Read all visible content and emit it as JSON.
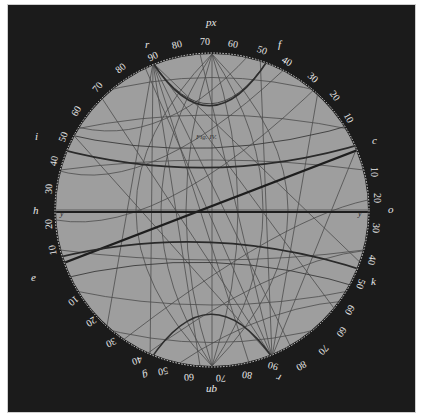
{
  "figure": {
    "title": "Fig. IV.",
    "type": "stereographic projection net",
    "colors": {
      "background": "#1b1b1b",
      "disc": "#9c9c9c",
      "grid": "#4a4a4a",
      "heavy_line": "#1e1e1e",
      "label": "#e8e8e8"
    }
  },
  "pole_labels": {
    "top": "px",
    "top_left": "r",
    "top_right": "f",
    "left_upper": "i",
    "left_mid": "h",
    "left_lower": "e",
    "right_upper": "c",
    "right_mid": "o",
    "right_lower": "k",
    "bottom": "qn",
    "bottom_left": "g",
    "bottom_right": "r",
    "diameter_left": "y",
    "diameter_right": "y"
  },
  "scale": {
    "top_arc": [
      "90",
      "80",
      "70",
      "60",
      "50",
      "40",
      "30",
      "20",
      "10"
    ],
    "left_arc_top": [
      "80",
      "70",
      "60",
      "50",
      "40",
      "30"
    ],
    "left_arc_bottom": [
      "20",
      "10"
    ],
    "right_arc": [
      "10",
      "20",
      "30",
      "40",
      "50",
      "60"
    ],
    "bottom_arc_left": [
      "10",
      "20",
      "30",
      "40",
      "50",
      "60",
      "70",
      "80",
      "90"
    ],
    "bottom_arc_right": [
      "60",
      "70",
      "80"
    ]
  }
}
